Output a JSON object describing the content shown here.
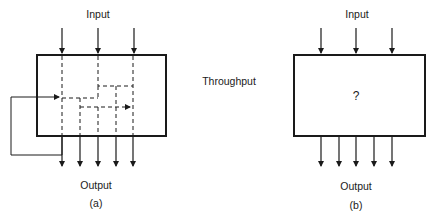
{
  "diagram": {
    "center_label": "Throughput",
    "panel_a": {
      "input_label": "Input",
      "output_label": "Output",
      "caption": "(a)",
      "inputs": 3,
      "outputs": 5,
      "internal": "dashed internal flow paths with feedback loop"
    },
    "panel_b": {
      "input_label": "Input",
      "output_label": "Output",
      "caption": "(b)",
      "box_text": "?",
      "inputs": 3,
      "outputs": 5
    }
  },
  "colors": {
    "stroke": "#1a1a1a",
    "background": "#ffffff"
  }
}
